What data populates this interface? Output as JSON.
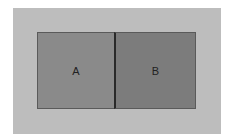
{
  "diagram": {
    "colors": {
      "background": "#ffffff",
      "outer": "#bdbdbd",
      "box_a": "#8a8a8a",
      "box_b": "#7c7c7c",
      "divider": "#2a2a2a"
    },
    "boxes": [
      {
        "label": "A"
      },
      {
        "label": "B"
      }
    ]
  }
}
